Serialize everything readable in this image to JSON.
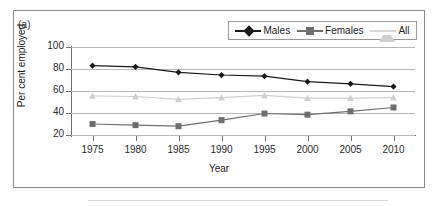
{
  "figure": {
    "panel_label": "(a)"
  },
  "chart_data": {
    "type": "line",
    "title": "",
    "panel": "(a)",
    "xlabel": "Year",
    "ylabel": "Per cent employed",
    "categories": [
      1975,
      1980,
      1985,
      1990,
      1995,
      2000,
      2005,
      2010
    ],
    "xtick_labels": [
      "1975",
      "1980",
      "1985",
      "1990",
      "1995",
      "2000",
      "2005",
      "2010"
    ],
    "ytick_labels": [
      "20",
      "40",
      "60",
      "80",
      "100"
    ],
    "yticks": [
      20,
      40,
      60,
      80,
      100
    ],
    "ylim": [
      20,
      100
    ],
    "xlim": [
      1972.5,
      2012.5
    ],
    "grid": "horizontal",
    "legend_position": "top-right",
    "series": [
      {
        "name": "Males",
        "marker": "diamond",
        "color": "#1a1a1a",
        "values": [
          83,
          82,
          77,
          74.5,
          73.5,
          68.5,
          66.5,
          64
        ]
      },
      {
        "name": "Females",
        "marker": "square",
        "color": "#6e6e6e",
        "values": [
          30,
          29,
          28,
          33.5,
          39.5,
          38.5,
          41.5,
          45
        ]
      },
      {
        "name": "All",
        "marker": "triangle",
        "color": "#cfcfcf",
        "values": [
          55.5,
          55,
          52.5,
          54,
          56,
          53.5,
          53.5,
          54
        ]
      }
    ]
  },
  "legend": {
    "items": [
      {
        "label": "Males"
      },
      {
        "label": "Females"
      },
      {
        "label": "All"
      }
    ]
  }
}
